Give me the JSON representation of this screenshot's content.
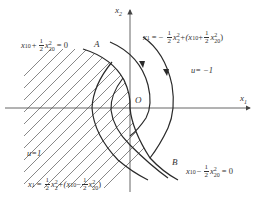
{
  "diagram": {
    "type": "phase-plane",
    "axes": {
      "x_label": "x",
      "x_sub": "1",
      "y_label": "x",
      "y_sub": "2",
      "origin_label": "O"
    },
    "points": {
      "A": "A",
      "B": "B"
    },
    "regions": {
      "left_control": "u=1",
      "right_control": "u= −1"
    },
    "equations": {
      "switch_upper": {
        "lhs": "x",
        "lhs_sub": "10",
        "op": "+",
        "frac_num": "1",
        "frac_den": "2",
        "var": "x",
        "var_sub": "20",
        "var_sup": "2",
        "rhs": "= 0"
      },
      "switch_lower": {
        "lhs": "x",
        "lhs_sub": "10",
        "op": "−",
        "frac_num": "1",
        "frac_den": "2",
        "var": "x",
        "var_sub": "20",
        "var_sup": "2",
        "rhs": "= 0"
      },
      "traj_u_minus": {
        "lhs": "x",
        "lhs_sub": "1",
        "eq": "= −",
        "frac_num": "1",
        "frac_den": "2",
        "term": "x",
        "term_sub": "2",
        "term_sup": "2",
        "plus": "+(x",
        "inner_sub": "10",
        "inner_op": "+",
        "frac2_num": "1",
        "frac2_den": "2",
        "inner_var": "x",
        "inner_var_sub": "20",
        "inner_var_sup": "2",
        "close": ")"
      },
      "traj_u_plus": {
        "lhs": "x",
        "lhs_sub": "1",
        "eq": "=",
        "frac_num": "1",
        "frac_den": "2",
        "term": "x",
        "term_sub": "2",
        "term_sup": "2",
        "plus": "+(x",
        "inner_sub": "10",
        "inner_op": "−",
        "frac2_num": "1",
        "frac2_den": "2",
        "inner_var": "x",
        "inner_var_sub": "20",
        "inner_var_sup": "2",
        "close": ")"
      }
    },
    "colors": {
      "line": "#2a2a2a",
      "axis": "#555555",
      "hatch": "#6a6a6a",
      "text": "#333333"
    }
  }
}
